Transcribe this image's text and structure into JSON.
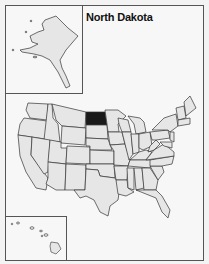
{
  "title": "North Dakota",
  "highlighted_state": "North Dakota",
  "colors": {
    "highlight": "#1a1a1a",
    "state_fill": "#e6e6e6",
    "state_border": "#333333",
    "background": "#f7f7f7"
  },
  "insets": {
    "alaska": "Alaska",
    "hawaii": "Hawaii"
  }
}
